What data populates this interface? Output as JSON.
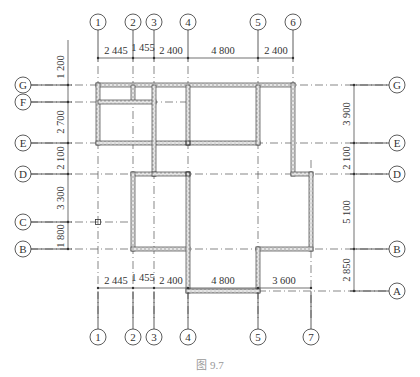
{
  "figure": {
    "caption": "图 9.7",
    "type": "architectural floor plan"
  },
  "grid_columns": [
    {
      "id": "1",
      "x": 98
    },
    {
      "id": "2",
      "x": 133
    },
    {
      "id": "3",
      "x": 154
    },
    {
      "id": "4",
      "x": 188
    },
    {
      "id": "5",
      "x": 258
    },
    {
      "id": "6",
      "x": 293
    },
    {
      "id": "7",
      "x": 311
    }
  ],
  "grid_rows": [
    {
      "id": "G",
      "y": 85
    },
    {
      "id": "F",
      "y": 102
    },
    {
      "id": "E",
      "y": 143
    },
    {
      "id": "D",
      "y": 174
    },
    {
      "id": "C",
      "y": 222
    },
    {
      "id": "B",
      "y": 249
    },
    {
      "id": "A",
      "y": 291
    }
  ],
  "dimensions": {
    "top": [
      "2 445",
      "1 455",
      "2 400",
      "4 800",
      "2 400"
    ],
    "bottom": [
      "2 445",
      "1 455",
      "2 400",
      "4 800",
      "3 600"
    ],
    "left": [
      "1 200",
      "2 700",
      "2 100",
      "3 300",
      "1 800"
    ],
    "right": [
      "3 900",
      "2 100",
      "5 100",
      "2 850"
    ]
  },
  "labels": {
    "top_axes": [
      "1",
      "2",
      "3",
      "4",
      "5",
      "6"
    ],
    "bottom_axes": [
      "1",
      "2",
      "3",
      "4",
      "5",
      "7"
    ],
    "left_axes": [
      "G",
      "F",
      "E",
      "D",
      "C",
      "B"
    ],
    "right_axes": [
      "G",
      "E",
      "D",
      "B",
      "A"
    ]
  },
  "colors": {
    "line": "#333333",
    "wall_fill": "#d8d8d8",
    "caption": "#999999"
  }
}
